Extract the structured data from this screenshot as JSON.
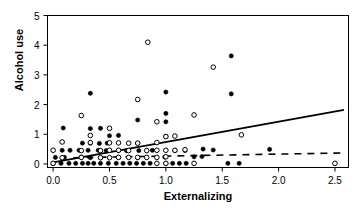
{
  "chart_data": {
    "type": "scatter",
    "title": "",
    "xlabel": "Externalizing",
    "ylabel": "Alcohol use",
    "xlim": [
      -0.05,
      2.62
    ],
    "ylim": [
      -0.12,
      5.0
    ],
    "xticks": [
      "0.0",
      "0.5",
      "1.0",
      "1.5",
      "2.0",
      "2.5"
    ],
    "xtick_values": [
      0.0,
      0.5,
      1.0,
      1.5,
      2.0,
      2.5
    ],
    "yticks": [
      "0",
      "1",
      "2",
      "3",
      "4",
      "5"
    ],
    "ytick_values": [
      0,
      1,
      2,
      3,
      4,
      5
    ],
    "grid": false,
    "legend": "none",
    "series": [
      {
        "name": "filled-circles",
        "marker": "filled-circle",
        "color": "#000000",
        "points": [
          [
            0.0,
            0.02
          ],
          [
            0.07,
            0.02
          ],
          [
            0.14,
            0.02
          ],
          [
            0.2,
            0.02
          ],
          [
            0.26,
            0.02
          ],
          [
            0.31,
            0.02
          ],
          [
            0.36,
            0.02
          ],
          [
            0.42,
            0.02
          ],
          [
            0.49,
            0.02
          ],
          [
            0.56,
            0.02
          ],
          [
            0.62,
            0.02
          ],
          [
            0.68,
            0.02
          ],
          [
            0.74,
            0.02
          ],
          [
            0.8,
            0.02
          ],
          [
            0.86,
            0.02
          ],
          [
            1.0,
            0.02
          ],
          [
            1.06,
            0.02
          ],
          [
            1.12,
            0.02
          ],
          [
            1.18,
            0.02
          ],
          [
            1.55,
            0.02
          ],
          [
            1.65,
            0.02
          ],
          [
            0.02,
            0.22
          ],
          [
            0.1,
            0.22
          ],
          [
            0.25,
            0.23
          ],
          [
            0.33,
            0.21
          ],
          [
            0.58,
            0.22
          ],
          [
            0.75,
            0.21
          ],
          [
            0.99,
            0.23
          ],
          [
            1.25,
            0.24
          ],
          [
            1.32,
            0.25
          ],
          [
            1.92,
            0.49
          ],
          [
            0.08,
            0.46
          ],
          [
            0.15,
            0.46
          ],
          [
            0.23,
            0.46
          ],
          [
            0.31,
            0.46
          ],
          [
            0.4,
            0.46
          ],
          [
            0.47,
            0.45
          ],
          [
            0.58,
            0.45
          ],
          [
            0.65,
            0.45
          ],
          [
            0.76,
            0.45
          ],
          [
            0.88,
            0.46
          ],
          [
            1.08,
            0.45
          ],
          [
            1.17,
            0.45
          ],
          [
            1.33,
            0.5
          ],
          [
            1.42,
            0.47
          ],
          [
            0.26,
            0.7
          ],
          [
            0.33,
            0.7
          ],
          [
            0.41,
            0.69
          ],
          [
            0.48,
            0.7
          ],
          [
            0.75,
            0.7
          ],
          [
            0.5,
            0.95
          ],
          [
            0.58,
            0.96
          ],
          [
            1.0,
            0.93
          ],
          [
            0.09,
            1.21
          ],
          [
            0.33,
            1.19
          ],
          [
            0.42,
            1.2
          ],
          [
            1.0,
            1.42
          ],
          [
            0.75,
            1.48
          ],
          [
            1.0,
            1.7
          ],
          [
            0.33,
            2.38
          ],
          [
            1.0,
            2.42
          ],
          [
            1.58,
            2.36
          ],
          [
            1.58,
            3.64
          ]
        ]
      },
      {
        "name": "open-circles",
        "marker": "open-circle",
        "color": "#000000",
        "points": [
          [
            0.0,
            0.02
          ],
          [
            0.92,
            0.02
          ],
          [
            1.0,
            0.02
          ],
          [
            1.25,
            0.02
          ],
          [
            2.5,
            0.02
          ],
          [
            0.08,
            0.21
          ],
          [
            0.25,
            0.22
          ],
          [
            0.42,
            0.21
          ],
          [
            0.5,
            0.21
          ],
          [
            0.58,
            0.22
          ],
          [
            0.67,
            0.22
          ],
          [
            0.75,
            0.22
          ],
          [
            0.83,
            0.22
          ],
          [
            0.92,
            0.22
          ],
          [
            1.0,
            0.24
          ],
          [
            0.0,
            0.46
          ],
          [
            0.25,
            0.45
          ],
          [
            0.42,
            0.45
          ],
          [
            0.5,
            0.46
          ],
          [
            0.58,
            0.46
          ],
          [
            0.67,
            0.45
          ],
          [
            0.83,
            0.45
          ],
          [
            0.92,
            0.46
          ],
          [
            1.0,
            0.46
          ],
          [
            1.08,
            0.46
          ],
          [
            1.17,
            0.48
          ],
          [
            0.08,
            0.74
          ],
          [
            0.33,
            0.72
          ],
          [
            0.5,
            0.71
          ],
          [
            0.58,
            0.71
          ],
          [
            0.67,
            0.7
          ],
          [
            0.75,
            0.7
          ],
          [
            0.92,
            0.72
          ],
          [
            1.0,
            0.92
          ],
          [
            1.08,
            0.94
          ],
          [
            1.67,
            0.98
          ],
          [
            0.33,
            0.96
          ],
          [
            0.5,
            1.2
          ],
          [
            0.25,
            1.63
          ],
          [
            0.92,
            1.42
          ],
          [
            1.25,
            1.65
          ],
          [
            0.75,
            2.17
          ],
          [
            1.42,
            3.26
          ],
          [
            0.84,
            4.1
          ]
        ]
      }
    ],
    "lines": [
      {
        "name": "solid-regression-line",
        "style": "solid",
        "color": "#000000",
        "from": [
          0.0,
          0.05
        ],
        "to": [
          2.58,
          1.82
        ]
      },
      {
        "name": "dashed-regression-line",
        "style": "dashed",
        "color": "#000000",
        "from": [
          0.18,
          0.21
        ],
        "to": [
          2.58,
          0.37
        ]
      }
    ]
  }
}
